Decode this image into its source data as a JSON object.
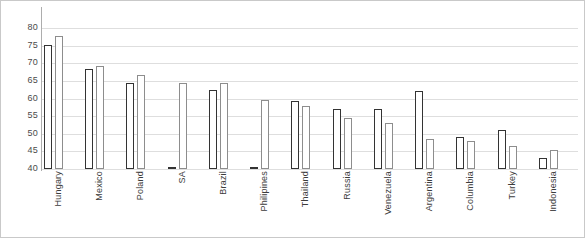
{
  "chart_data": {
    "type": "bar",
    "title": "",
    "subtitle": "",
    "xlabel": "",
    "ylabel": "",
    "ylim": [
      40,
      80
    ],
    "yticks": [
      40,
      45,
      50,
      55,
      60,
      65,
      70,
      75,
      80
    ],
    "grid": true,
    "legend": "none",
    "orientation": "vertical",
    "categories": [
      "Hungary",
      "Mexico",
      "Poland",
      "SA",
      "Brazil",
      "Philipines",
      "Thailand",
      "Russia",
      "Venezuela",
      "Argentina",
      "Columbia",
      "Turkey",
      "Indonesia"
    ],
    "series": [
      {
        "name": "Series 1",
        "color": "#333333",
        "values": [
          75.3,
          68.3,
          64.5,
          40.2,
          62.5,
          40.2,
          59.3,
          57.0,
          57.0,
          62.0,
          49.0,
          51.0,
          43.0
        ]
      },
      {
        "name": "Series 2",
        "color": "#8d8d8d",
        "values": [
          77.7,
          69.1,
          66.6,
          64.5,
          64.5,
          59.5,
          58.0,
          54.6,
          53.0,
          48.6,
          48.0,
          46.5,
          45.5
        ]
      }
    ]
  },
  "axis": {
    "y_tick_labels": [
      "80",
      "75",
      "70",
      "65",
      "60",
      "55",
      "50",
      "45",
      "40"
    ]
  }
}
